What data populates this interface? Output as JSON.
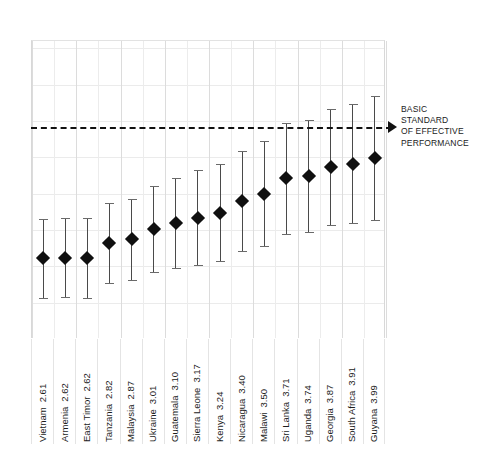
{
  "chart_data": {
    "type": "scatter",
    "title": "",
    "subtitle": "",
    "xlabel": "",
    "ylabel": "",
    "ylim": [
      1.5,
      5.6
    ],
    "grid": true,
    "legend": null,
    "categories": [
      "Vietnam",
      "Armenia",
      "East Timor",
      "Tanzania",
      "Malaysia",
      "Ukraine",
      "Guatemala",
      "Sierra Leone",
      "Kenya",
      "Nicaragua",
      "Malawi",
      "Sri Lanka",
      "Uganda",
      "Georgia",
      "South Africa",
      "Guyana"
    ],
    "values": [
      2.61,
      2.62,
      2.62,
      2.82,
      2.87,
      3.01,
      3.1,
      3.17,
      3.24,
      3.4,
      3.5,
      3.71,
      3.74,
      3.87,
      3.91,
      3.99
    ],
    "value_labels": [
      "2.61",
      "2.62",
      "2.62",
      "2.82",
      "2.87",
      "3.01",
      "3.10",
      "3.17",
      "3.24",
      "3.40",
      "3.50",
      "3.71",
      "3.74",
      "3.87",
      "3.91",
      "3.99"
    ],
    "error_low": [
      2.07,
      2.08,
      2.07,
      2.27,
      2.31,
      2.42,
      2.48,
      2.52,
      2.57,
      2.71,
      2.78,
      2.95,
      2.97,
      3.07,
      3.09,
      3.14
    ],
    "error_high": [
      3.15,
      3.16,
      3.17,
      3.37,
      3.43,
      3.6,
      3.72,
      3.82,
      3.91,
      4.09,
      4.22,
      4.47,
      4.51,
      4.67,
      4.73,
      4.84
    ],
    "marker": "diamond",
    "marker_color": "#101010",
    "errorbar_color": "#4a4a4a",
    "reference_line": {
      "value": 5.0,
      "style": "dashed",
      "color": "#111111",
      "label": "BASIC STANDARD OF EFFECTIVE PERFORMANCE",
      "label_lines": [
        "BASIC",
        "STANDARD",
        "OF EFFECTIVE",
        "PERFORMANCE"
      ],
      "arrow": true
    }
  },
  "annotation": {
    "line1": "BASIC",
    "line2": "STANDARD",
    "line3": "OF EFFECTIVE",
    "line4": "PERFORMANCE"
  }
}
